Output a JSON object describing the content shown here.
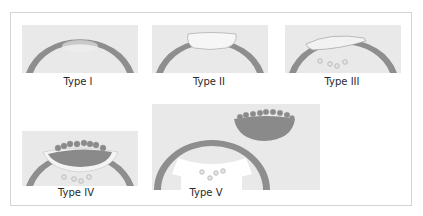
{
  "figure": {
    "panels": [
      {
        "id": "type-1",
        "label": "Type I"
      },
      {
        "id": "type-2",
        "label": "Type II"
      },
      {
        "id": "type-3",
        "label": "Type III"
      },
      {
        "id": "type-4",
        "label": "Type IV"
      },
      {
        "id": "type-5",
        "label": "Type V"
      }
    ]
  },
  "colors": {
    "background_panel": "#e9e9e9",
    "arc": "#8e8e8e",
    "mass": "#8a8a8a",
    "light_fill": "#f4f4f4",
    "outline": "#9a9a9a",
    "frame_border": "#d4d4d4"
  }
}
